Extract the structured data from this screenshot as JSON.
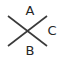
{
  "figure": {
    "background_color": "#ffffff",
    "width": 62,
    "height": 61,
    "stroke_color": "#3a3a3a",
    "label_color": "#262626",
    "stroke_width": 1.6,
    "label_font_size": 13
  },
  "lines": {
    "down_right": {
      "name": "diagonal-down-right",
      "x1": 8,
      "y1": 16,
      "x2": 47,
      "y2": 46
    },
    "up_right": {
      "name": "diagonal-up-right",
      "x1": 8,
      "y1": 46,
      "x2": 47,
      "y2": 16
    },
    "intersection": {
      "x": 27.5,
      "y": 31
    }
  },
  "labels": {
    "top": {
      "text": "A",
      "x": 30,
      "y": 11
    },
    "bottom": {
      "text": "B",
      "x": 30,
      "y": 51
    },
    "right": {
      "text": "C",
      "x": 52,
      "y": 31
    }
  }
}
